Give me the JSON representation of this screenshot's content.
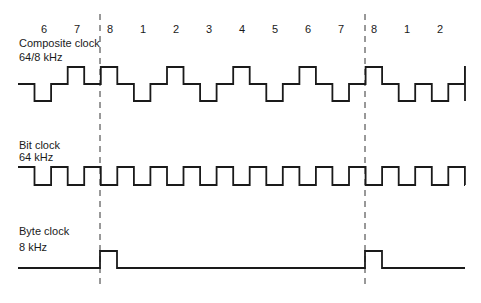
{
  "diagram": {
    "title": "",
    "bit_numbers": [
      {
        "label": "6",
        "x": 44
      },
      {
        "label": "7",
        "x": 77
      },
      {
        "label": "8",
        "x": 110
      },
      {
        "label": "1",
        "x": 143
      },
      {
        "label": "2",
        "x": 176
      },
      {
        "label": "3",
        "x": 209
      },
      {
        "label": "4",
        "x": 242
      },
      {
        "label": "5",
        "x": 275
      },
      {
        "label": "6",
        "x": 308
      },
      {
        "label": "7",
        "x": 341
      },
      {
        "label": "8",
        "x": 374
      },
      {
        "label": "1",
        "x": 407
      },
      {
        "label": "2",
        "x": 440
      }
    ],
    "signals": [
      {
        "name": "Composite clock",
        "rate": "64/8 kHz",
        "levels": {
          "high": 67,
          "mid": 84,
          "low": 101
        },
        "segments": [
          "mid",
          "low",
          "mid",
          "high",
          "mid",
          "high",
          "mid",
          "low",
          "mid",
          "high",
          "mid",
          "low",
          "mid",
          "high",
          "mid",
          "low",
          "mid",
          "high",
          "mid",
          "low",
          "mid",
          "high",
          "mid",
          "low",
          "mid",
          "low",
          "mid",
          "high",
          "mid",
          "low",
          "mid"
        ],
        "start_x": 18,
        "step": 16.55
      },
      {
        "name": "Bit clock",
        "rate": "64 kHz",
        "levels": {
          "high": 167,
          "low": 185
        },
        "segments": [
          "high",
          "low",
          "high",
          "low",
          "high",
          "low",
          "high",
          "low",
          "high",
          "low",
          "high",
          "low",
          "high",
          "low",
          "high",
          "low",
          "high",
          "low",
          "high",
          "low",
          "high",
          "low",
          "high",
          "low",
          "high",
          "low",
          "high",
          "low"
        ],
        "start_x": 18,
        "step": 16.55
      },
      {
        "name": "Byte clock",
        "rate": "8 kHz",
        "levels": {
          "high": 251,
          "low": 268
        },
        "pulses": [
          [
            100,
            117
          ],
          [
            365,
            382
          ]
        ],
        "start_x": 18,
        "end_x": 465
      }
    ],
    "frame_markers": [
      100,
      365
    ],
    "colors": {
      "line": "#1a1a1a",
      "dash": "#333333",
      "background": "#ffffff"
    }
  }
}
